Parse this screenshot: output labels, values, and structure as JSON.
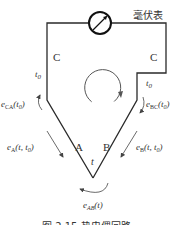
{
  "diagram": {
    "meter_label": "毫伏表",
    "junction_labels": {
      "left_c": "C",
      "right_c": "C",
      "left_t0": "t0",
      "right_t0": "t0",
      "wire_a": "A",
      "wire_b": "B",
      "hot_junction_t": "t"
    },
    "emf_labels": {
      "e_ca": "eCA(t0)",
      "e_bc": "eBC(t0)",
      "e_a": "eA(t, t0)",
      "e_b": "eB(t, t0)",
      "e_ab": "eAB(t)"
    },
    "caption": "图 2.15   热电偶回路",
    "colors": {
      "line": "#2a2a2a",
      "text": "#333333",
      "background": "#ffffff"
    }
  }
}
